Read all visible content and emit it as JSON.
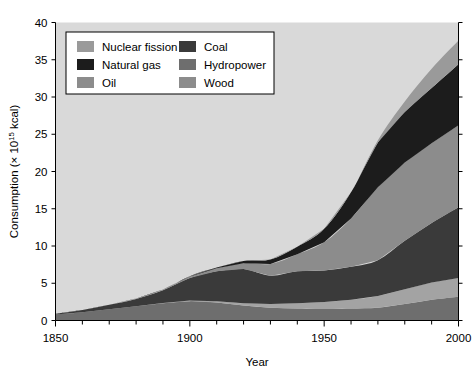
{
  "chart_data": {
    "type": "area",
    "stacked": true,
    "title": "",
    "xlabel": "Year",
    "ylabel": "Consumption (× 10¹⁵ kcal)",
    "ylabel_parts": {
      "pre": "Consumption (× 10",
      "sup": "15",
      "post": " kcal)"
    },
    "xlim": [
      1850,
      2000
    ],
    "ylim": [
      0,
      40
    ],
    "xticks": [
      1850,
      1900,
      1950,
      2000
    ],
    "xtick_labels": [
      "1850",
      "1900",
      "1950",
      "2000"
    ],
    "xminor_step": 10,
    "yticks": [
      0,
      5,
      10,
      15,
      20,
      25,
      30,
      35,
      40
    ],
    "ytick_labels": [
      "0",
      "5",
      "10",
      "15",
      "20",
      "25",
      "30",
      "35",
      "40"
    ],
    "grid": false,
    "plot_background": "#d9d9d9",
    "legend_position": "top-left-inside",
    "x": [
      1850,
      1860,
      1870,
      1880,
      1890,
      1900,
      1910,
      1920,
      1930,
      1940,
      1950,
      1960,
      1970,
      1980,
      1990,
      2000
    ],
    "series": [
      {
        "name": "Wood",
        "color": "#6e6e6e",
        "values": [
          0.8,
          1.1,
          1.5,
          1.9,
          2.3,
          2.6,
          2.4,
          2.0,
          1.7,
          1.6,
          1.6,
          1.6,
          1.7,
          2.2,
          2.8,
          3.2
        ]
      },
      {
        "name": "Hydropower",
        "color": "#a3a3a3",
        "values": [
          0.0,
          0.0,
          0.0,
          0.0,
          0.05,
          0.1,
          0.2,
          0.3,
          0.5,
          0.7,
          0.9,
          1.2,
          1.6,
          2.0,
          2.3,
          2.5
        ]
      },
      {
        "name": "Coal",
        "color": "#3a3a3a",
        "values": [
          0.1,
          0.3,
          0.6,
          1.0,
          1.7,
          3.0,
          4.0,
          4.6,
          3.8,
          4.3,
          4.2,
          4.4,
          4.8,
          6.5,
          8.0,
          9.5
        ]
      },
      {
        "name": "Oil",
        "color": "#8c8c8c",
        "values": [
          0.0,
          0.0,
          0.02,
          0.05,
          0.1,
          0.2,
          0.4,
          0.8,
          1.6,
          2.3,
          3.8,
          6.5,
          9.8,
          10.5,
          10.7,
          11.0
        ]
      },
      {
        "name": "Natural gas",
        "color": "#1c1c1c",
        "values": [
          0.0,
          0.0,
          0.0,
          0.0,
          0.0,
          0.05,
          0.1,
          0.3,
          0.6,
          1.0,
          1.8,
          3.5,
          6.0,
          6.8,
          7.4,
          8.2
        ]
      },
      {
        "name": "Nuclear fission",
        "color": "#9a9a9a",
        "values": [
          0.0,
          0.0,
          0.0,
          0.0,
          0.0,
          0.0,
          0.0,
          0.0,
          0.0,
          0.0,
          0.0,
          0.05,
          0.3,
          1.4,
          2.6,
          3.2
        ]
      }
    ],
    "legend": {
      "column1": [
        {
          "label": "Nuclear fission",
          "color": "#9a9a9a"
        },
        {
          "label": "Natural gas",
          "color": "#1c1c1c"
        },
        {
          "label": "Oil",
          "color": "#8c8c8c"
        }
      ],
      "column2": [
        {
          "label": "Coal",
          "color": "#3a3a3a"
        },
        {
          "label": "Hydropower",
          "color": "#6e6e6e"
        },
        {
          "label": "Wood",
          "color": "#8c8c8c"
        }
      ]
    }
  }
}
